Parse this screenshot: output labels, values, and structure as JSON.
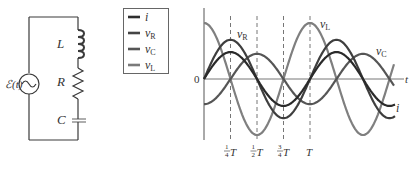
{
  "circuit": {
    "source_label": "ℰ(t)",
    "inductor_label": "L",
    "resistor_label": "R",
    "capacitor_label": "C",
    "line_color": "#3a3a3a"
  },
  "legend": {
    "items": [
      {
        "symbol": "i",
        "sub": "",
        "color": "#2e2e2e"
      },
      {
        "symbol": "v",
        "sub": "R",
        "color": "#444444"
      },
      {
        "symbol": "v",
        "sub": "C",
        "color": "#555555"
      },
      {
        "symbol": "v",
        "sub": "L",
        "color": "#7a7a7a"
      }
    ]
  },
  "graph": {
    "origin_label": "0",
    "t_axis_label": "t",
    "curve_labels": {
      "vR": "v",
      "vR_sub": "R",
      "vL": "v",
      "vL_sub": "L",
      "vC": "v",
      "vC_sub": "C",
      "i": "i"
    },
    "tick_labels": [
      {
        "num": "1",
        "den": "4",
        "T": "T"
      },
      {
        "num": "1",
        "den": "2",
        "T": "T"
      },
      {
        "num": "3",
        "den": "4",
        "T": "T"
      },
      {
        "num": "",
        "den": "",
        "T": "T"
      }
    ]
  },
  "chart_data": {
    "type": "line",
    "title": "",
    "xlabel": "t",
    "ylabel": "",
    "x_ticks": [
      "1/4 T",
      "1/2 T",
      "3/4 T",
      "T"
    ],
    "series": [
      {
        "name": "i",
        "shape": "sin(2πt/T)",
        "amplitude": 0.48,
        "phase_deg": 0
      },
      {
        "name": "v_R",
        "shape": "sin(2πt/T)",
        "amplitude": 0.7,
        "phase_deg": 0
      },
      {
        "name": "v_C",
        "shape": "-cos(2πt/T)",
        "amplitude": 0.45,
        "phase_deg": -90
      },
      {
        "name": "v_L",
        "shape": "cos(2πt/T)",
        "amplitude": 1.0,
        "phase_deg": 90
      }
    ],
    "xlim": [
      0,
      1.5
    ],
    "units_x": "T",
    "grid": false,
    "dashed_verticals_at": [
      0.25,
      0.5,
      0.75,
      1.0
    ]
  }
}
